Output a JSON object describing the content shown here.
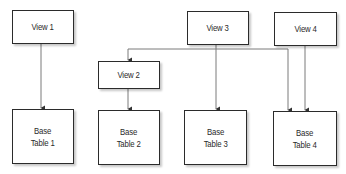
{
  "diagram": {
    "type": "view-to-base-table dependency diagram",
    "views": [
      {
        "id": "view1",
        "label": "View 1"
      },
      {
        "id": "view2",
        "label": "View 2"
      },
      {
        "id": "view3",
        "label": "View 3"
      },
      {
        "id": "view4",
        "label": "View 4"
      }
    ],
    "base_tables": [
      {
        "id": "bt1",
        "line1": "Base",
        "line2": "Table 1"
      },
      {
        "id": "bt2",
        "line1": "Base",
        "line2": "Table 2"
      },
      {
        "id": "bt3",
        "line1": "Base",
        "line2": "Table 3"
      },
      {
        "id": "bt4",
        "line1": "Base",
        "line2": "Table 4"
      }
    ],
    "edges": [
      {
        "from": "View 1",
        "to": "Base Table 1"
      },
      {
        "from": "View 2",
        "to": "Base Table 2"
      },
      {
        "from": "View 3",
        "to": "Base Table 3"
      },
      {
        "from": "View 4",
        "to": "Base Table 4"
      },
      {
        "from": "shared connector",
        "to": "View 2"
      },
      {
        "from": "shared connector",
        "to": "Base Table 4"
      }
    ],
    "colors": {
      "line": "#7a7a7a",
      "border": "#2b2b2b",
      "text": "#2a2a2a"
    }
  }
}
